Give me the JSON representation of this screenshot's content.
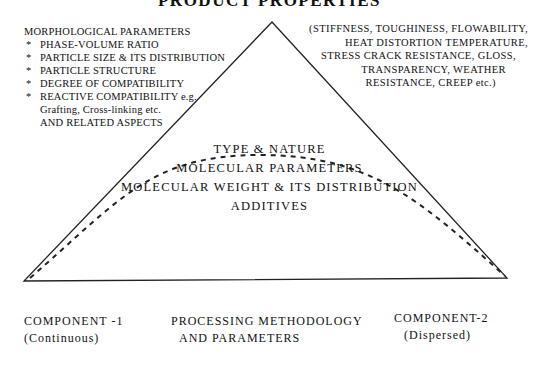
{
  "title": "PRODUCT PROPERTIES",
  "morphology": {
    "header": "MORPHOLOGICAL PARAMETERS",
    "items": [
      "PHASE-VOLUME RATIO",
      "PARTICLE SIZE & ITS DISTRIBUTION",
      "PARTICLE STRUCTURE",
      "DEGREE OF COMPATIBILITY",
      "REACTIVE COMPATIBILITY e.g."
    ],
    "continuation": [
      "Grafting, Cross-linking etc.",
      "AND RELATED ASPECTS"
    ],
    "bullet": "*"
  },
  "properties": {
    "lines": [
      "(STIFFNESS, TOUGHINESS, FLOWABILITY,",
      "HEAT DISTORTION TEMPERATURE,",
      "STRESS CRACK RESISTANCE, GLOSS,",
      "TRANSPARENCY,  WEATHER",
      "RESISTANCE,  CREEP etc.)"
    ]
  },
  "center": {
    "line1": "TYPE & NATURE",
    "line2": "MOLECULAR PARAMETERS",
    "line3": "MOLECULAR WEIGHT & ITS DISTRIBUTION",
    "line4": "ADDITIVES"
  },
  "bottom": {
    "component1": {
      "name": "COMPONENT -1",
      "type": "(Continuous)"
    },
    "processing": {
      "line1": "PROCESSING METHODOLOGY",
      "line2": "AND PARAMETERS"
    },
    "component2": {
      "name": "COMPONENT-2",
      "type": "(Dispersed)"
    }
  }
}
